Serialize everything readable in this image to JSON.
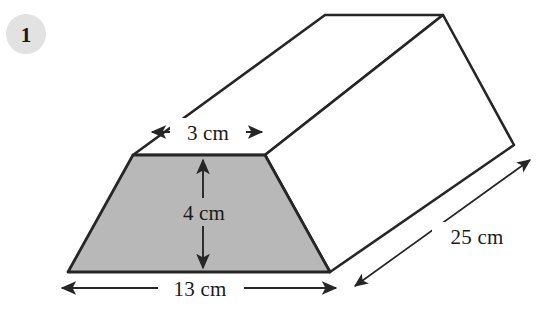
{
  "figure": {
    "badge": {
      "label": "1",
      "shape": "circle",
      "fill_color": "#e2e2e2"
    },
    "solid": {
      "name": "trapezoidal-prism",
      "outline_color": "#262626",
      "face_fill_color": "#ffffff",
      "front_face_fill_color": "#b8b8b8"
    },
    "dimensions": [
      {
        "id": "top-width",
        "label": "3 cm",
        "value": 3,
        "unit": "cm",
        "orientation": "horizontal",
        "arrow_style": "double"
      },
      {
        "id": "height",
        "label": "4 cm",
        "value": 4,
        "unit": "cm",
        "orientation": "vertical",
        "arrow_style": "double"
      },
      {
        "id": "base-width",
        "label": "13 cm",
        "value": 13,
        "unit": "cm",
        "orientation": "horizontal",
        "arrow_style": "double"
      },
      {
        "id": "length",
        "label": "25 cm",
        "value": 25,
        "unit": "cm",
        "orientation": "diagonal",
        "arrow_style": "double"
      }
    ]
  }
}
